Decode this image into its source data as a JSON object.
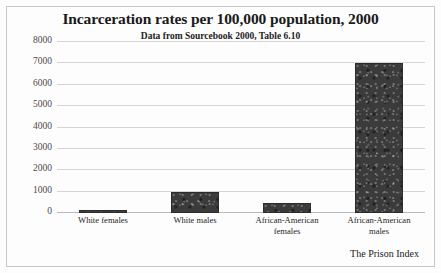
{
  "chart_data": {
    "type": "bar",
    "title": "Incarceration rates per 100,000 population, 2000",
    "subtitle": "Data from Sourcebook 2000, Table 6.10",
    "source_note": "The Prison Index",
    "xlabel": "",
    "ylabel": "",
    "ylim": [
      0,
      8000
    ],
    "grid": true,
    "legend": "none",
    "categories": [
      "White females",
      "White males",
      "African-American females",
      "African-American males"
    ],
    "category_lines": [
      [
        "White females"
      ],
      [
        "White males"
      ],
      [
        "African-American",
        "females"
      ],
      [
        "African-American",
        "males"
      ]
    ],
    "values": [
      140,
      1000,
      480,
      7000
    ],
    "ytick_labels": [
      "8000",
      "7000",
      "6000",
      "5000",
      "4000",
      "3000",
      "2000",
      "1000",
      "0"
    ],
    "ytick_values": [
      8000,
      7000,
      6000,
      5000,
      4000,
      3000,
      2000,
      1000,
      0
    ],
    "bar_color": "#3b3b3b",
    "gridline_color": "#d4d4d4",
    "text_color": "#1a1a1a",
    "background_color": "#fdfdfd"
  }
}
